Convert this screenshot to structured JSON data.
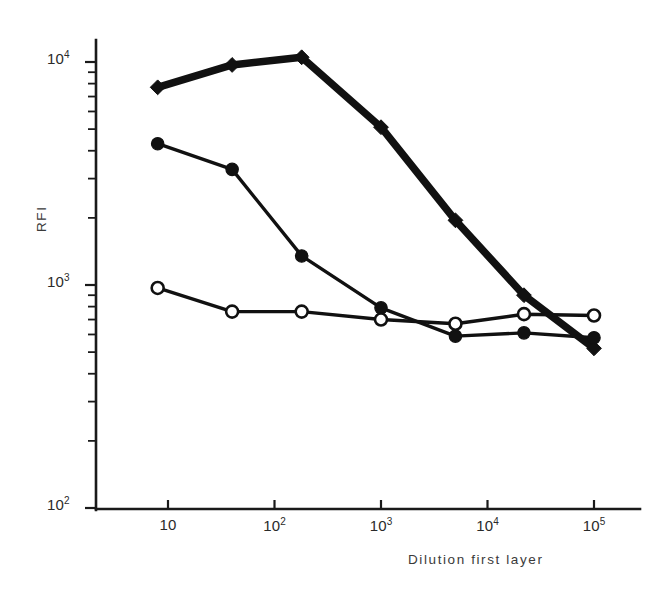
{
  "figure": {
    "background": "#ffffff",
    "ink_color": "#111111"
  },
  "chart_data": {
    "type": "line",
    "title": "",
    "xlabel": "Dilution first layer",
    "ylabel": "RFI",
    "xscale": "log",
    "yscale": "log",
    "xlim": [
      5.5,
      160000
    ],
    "ylim": [
      100,
      13000
    ],
    "grid": false,
    "legend_position": "none",
    "x_tick_labels": [
      "10",
      "10²",
      "10³",
      "10⁴",
      "10⁵"
    ],
    "x_tick_values": [
      10,
      100,
      1000,
      10000,
      100000
    ],
    "y_tick_labels": [
      "10²",
      "10³",
      "10⁴"
    ],
    "y_tick_values": [
      100,
      1000,
      10000
    ],
    "series": [
      {
        "name": "filled-diamond-series",
        "marker": "filled-diamond",
        "line_width": "thick",
        "x": [
          8,
          40,
          180,
          1000,
          5000,
          22000,
          100000
        ],
        "y": [
          7700,
          9700,
          10500,
          5100,
          1950,
          900,
          520
        ]
      },
      {
        "name": "filled-circle-series",
        "marker": "filled-circle",
        "line_width": "thin",
        "x": [
          8,
          40,
          180,
          1000,
          5000,
          22000,
          100000
        ],
        "y": [
          4300,
          3300,
          1350,
          790,
          590,
          610,
          580
        ]
      },
      {
        "name": "open-circle-series",
        "marker": "open-circle",
        "line_width": "thin",
        "x": [
          8,
          40,
          180,
          1000,
          5000,
          22000,
          100000
        ],
        "y": [
          970,
          760,
          760,
          700,
          670,
          740,
          730
        ]
      }
    ]
  },
  "axes": {
    "x_title": "Dilution first layer",
    "y_title": "RFI",
    "ticks_x": [
      {
        "label_base": "10",
        "label_exp": "",
        "value": 10
      },
      {
        "label_base": "10",
        "label_exp": "2",
        "value": 100
      },
      {
        "label_base": "10",
        "label_exp": "3",
        "value": 1000
      },
      {
        "label_base": "10",
        "label_exp": "4",
        "value": 10000
      },
      {
        "label_base": "10",
        "label_exp": "5",
        "value": 100000
      }
    ],
    "ticks_y": [
      {
        "label_base": "10",
        "label_exp": "4",
        "value": 10000
      },
      {
        "label_base": "10",
        "label_exp": "3",
        "value": 1000
      },
      {
        "label_base": "10",
        "label_exp": "2",
        "value": 100
      }
    ]
  }
}
